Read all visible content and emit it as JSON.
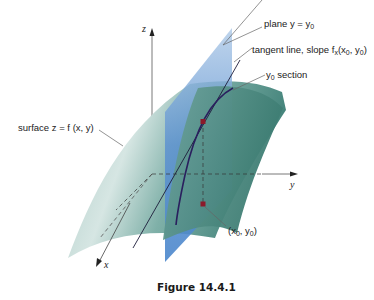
{
  "figure": {
    "caption": "Figure 14.4.1",
    "labels": {
      "plane": "plane y = y",
      "plane_sub": "0",
      "tangent": "tangent line, slope f",
      "tangent_sub_x": "x",
      "tangent_args": "(x",
      "tangent_args_sub": "0",
      "tangent_args_tail": ", y",
      "tangent_args_sub2": "0",
      "tangent_close": ")",
      "section_y": "y",
      "section_sub": "0",
      "section": " section",
      "surface": "surface z = f (x, y)",
      "point_open": "(x",
      "point_sub1": "0",
      "point_mid": ", y",
      "point_sub2": "0",
      "point_close": ")"
    },
    "axes": {
      "x": "x",
      "y": "y",
      "z": "z"
    },
    "colors": {
      "surface_light": "#c9dedb",
      "surface_dark": "#4f8f86",
      "plane": "#5b8fcf",
      "curve": "#2a1f5e",
      "point": "#8b1a2a"
    }
  }
}
